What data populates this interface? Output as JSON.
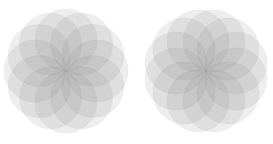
{
  "page": {
    "width": 273,
    "height": 144,
    "background_color": "#ffffff"
  },
  "palette": {
    "background": "#ffffff",
    "circle_fill": "#7f7f7f",
    "lightest_overlap": "#bcbcbc",
    "mid_overlap": "#a0a0a0",
    "darkest_center": "#4a4a4a",
    "circle_opacity": 0.135
  },
  "figures": [
    {
      "id": "rosette-left",
      "label": "Left rosette",
      "center_x": 66,
      "center_y": 71,
      "circle_count": 12,
      "circle_radius": 31,
      "arrangement_radius": 31,
      "rotation_deg": 0,
      "petal_count": 12,
      "outer_diameter": 124
    },
    {
      "id": "rosette-right",
      "label": "Right rosette",
      "center_x": 206,
      "center_y": 71,
      "circle_count": 12,
      "circle_radius": 31,
      "arrangement_radius": 31,
      "rotation_deg": 15,
      "petal_count": 12,
      "outer_diameter": 124
    }
  ],
  "chart_data": {
    "type": "scatter",
    "title": "",
    "subtitle": "",
    "xlabel": "",
    "ylabel": "",
    "xlim": [
      0,
      273
    ],
    "ylim": [
      0,
      144
    ],
    "grid": false,
    "legend": null,
    "annotations": [],
    "tick_labels": {
      "x": [],
      "y": []
    },
    "series": [
      {
        "name": "Left rosette circle centers",
        "marker": "circle-outline",
        "radius": 31,
        "fill": "#7f7f7f",
        "opacity": 0.135,
        "points": [
          {
            "x": 97.0,
            "y": 71.0
          },
          {
            "x": 92.8,
            "y": 86.5
          },
          {
            "x": 81.5,
            "y": 97.8
          },
          {
            "x": 66.0,
            "y": 102.0
          },
          {
            "x": 50.5,
            "y": 97.8
          },
          {
            "x": 39.2,
            "y": 86.5
          },
          {
            "x": 35.0,
            "y": 71.0
          },
          {
            "x": 39.2,
            "y": 55.5
          },
          {
            "x": 50.5,
            "y": 44.2
          },
          {
            "x": 66.0,
            "y": 40.0
          },
          {
            "x": 81.5,
            "y": 44.2
          },
          {
            "x": 92.8,
            "y": 55.5
          }
        ]
      },
      {
        "name": "Right rosette circle centers",
        "marker": "circle-outline",
        "radius": 31,
        "fill": "#7f7f7f",
        "opacity": 0.135,
        "points": [
          {
            "x": 236.9,
            "y": 63.0
          },
          {
            "x": 234.4,
            "y": 78.9
          },
          {
            "x": 225.0,
            "y": 91.8
          },
          {
            "x": 210.9,
            "y": 98.4
          },
          {
            "x": 195.3,
            "y": 97.4
          },
          {
            "x": 182.3,
            "y": 88.9
          },
          {
            "x": 175.1,
            "y": 75.0
          },
          {
            "x": 175.6,
            "y": 59.4
          },
          {
            "x": 183.4,
            "y": 46.0
          },
          {
            "x": 197.0,
            "y": 38.2
          },
          {
            "x": 212.6,
            "y": 38.1
          },
          {
            "x": 226.4,
            "y": 45.3
          }
        ]
      }
    ]
  }
}
